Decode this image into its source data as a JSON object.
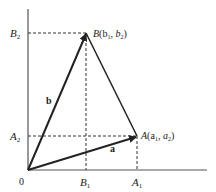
{
  "diagram": {
    "origin_label": "0",
    "axis_labels": {
      "B2": "B",
      "B2_sub": "2",
      "A2": "A",
      "A2_sub": "2",
      "B1": "B",
      "B1_sub": "1",
      "A1": "A",
      "A1_sub": "1"
    },
    "point_B": {
      "name": "B",
      "coords": "(b",
      "c1sub": "1",
      "sep": ", b",
      "c2sub": "2",
      "close": ")"
    },
    "point_A": {
      "name": "A",
      "coords": "(a",
      "c1sub": "1",
      "sep": ", a",
      "c2sub": "2",
      "close": ")"
    },
    "vector_a_label": "a",
    "vector_b_label": "b",
    "colors": {
      "line": "#222222",
      "dash": "#333333"
    }
  }
}
